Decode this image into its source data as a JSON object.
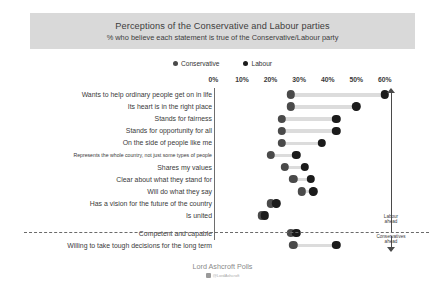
{
  "title": {
    "main": "Perceptions of the Conservative and Labour parties",
    "sub": "% who believe each statement is true of the Conservative/Labour party"
  },
  "legend": [
    {
      "label": "Conservative",
      "color": "#4a4a4a",
      "icon": "legend-dot-icon"
    },
    {
      "label": "Labour",
      "color": "#1b1b1b",
      "icon": "legend-dot-icon"
    }
  ],
  "annotations": {
    "labour_ahead": "Labour\nahead",
    "labour_ahead_line1": "Labour",
    "labour_ahead_line2": "ahead",
    "cons_ahead_line1": "Conservatives",
    "cons_ahead_line2": "ahead"
  },
  "footer": {
    "title": "Lord Ashcroft Polls",
    "handle": "@LordAshcroft"
  },
  "chart_data": {
    "type": "bar",
    "subtype": "dumbbell",
    "title": "Perceptions of the Conservative and Labour parties",
    "subtitle": "% who believe each statement is true of the Conservative/Labour party",
    "xlabel": "",
    "ylabel": "",
    "xlim": [
      0,
      65
    ],
    "tick_values": [
      0,
      10,
      20,
      30,
      40,
      50,
      60
    ],
    "tick_labels": [
      "0%",
      "10%",
      "20%",
      "30%",
      "40%",
      "50%",
      "60%"
    ],
    "grid": false,
    "legend_position": "top",
    "categories": [
      "Wants to help ordinary people get on in life",
      "Its heart is in the right place",
      "Stands for fairness",
      "Stands for opportunity for all",
      "On the side of people like me",
      "Represents the whole country, not just some types of people",
      "Shares my values",
      "Clear about what they stand for",
      "Will do what they say",
      "Has a vision for the future of the country",
      "Is united",
      "Competent and capable",
      "Willing to take tough decisions for the long term"
    ],
    "series": [
      {
        "name": "Conservative",
        "color": "#4a4a4a",
        "values": [
          27,
          27,
          24,
          24,
          24,
          20,
          25,
          28,
          31,
          20,
          17,
          27,
          28
        ]
      },
      {
        "name": "Labour",
        "color": "#1b1b1b",
        "values": [
          60,
          50,
          43,
          43,
          38,
          29,
          32,
          34,
          35,
          22,
          18,
          29,
          43
        ]
      }
    ],
    "divider_after_category_index": 10,
    "small_label_indices": [
      5
    ]
  }
}
